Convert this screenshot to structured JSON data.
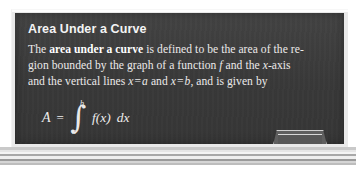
{
  "figure": {
    "kind": "chalkboard-definition-box",
    "title": "Area Under a Curve",
    "body_lines": [
      {
        "id": "line1",
        "segments": [
          {
            "type": "text",
            "value": "The "
          },
          {
            "type": "bold",
            "value": "area under a curve"
          },
          {
            "type": "text",
            "value": " is defined to be the area of the re-"
          }
        ],
        "plain": "The area under a curve is defined to be the area of the re-"
      },
      {
        "id": "line2",
        "segments": [
          {
            "type": "text",
            "value": "gion bounded by the graph of a function "
          },
          {
            "type": "math-italic",
            "value": "f"
          },
          {
            "type": "text",
            "value": " and the "
          },
          {
            "type": "math-italic",
            "value": "x"
          },
          {
            "type": "text",
            "value": "-axis"
          }
        ],
        "plain": "gion bounded by the graph of a function f and the x-axis"
      },
      {
        "id": "line3",
        "segments": [
          {
            "type": "text",
            "value": "and the vertical lines "
          },
          {
            "type": "math-italic",
            "value": "x"
          },
          {
            "type": "operator",
            "value": "="
          },
          {
            "type": "math-italic",
            "value": "a"
          },
          {
            "type": "text",
            "value": " and "
          },
          {
            "type": "math-italic",
            "value": "x"
          },
          {
            "type": "operator",
            "value": "="
          },
          {
            "type": "math-italic",
            "value": "b"
          },
          {
            "type": "text",
            "value": ", and is given by"
          }
        ],
        "plain": "and the vertical lines x = a and x = b, and is given by"
      }
    ],
    "formula": {
      "plain": "A = ∫ from a to b of f(x) dx",
      "lhs": "A",
      "equals": "=",
      "integral_sign": "∫",
      "lower_limit": "a",
      "upper_limit": "b",
      "integrand": "f(x)",
      "differential": "dx"
    },
    "chalk_tray": {
      "label": "chalk tray"
    },
    "colors": {
      "board": "#3c3c3c",
      "frame": "#e9e9e9",
      "chalk_text": "#eceaea",
      "title_text": "#f4f4f4",
      "page_background": "#ffffff"
    }
  }
}
